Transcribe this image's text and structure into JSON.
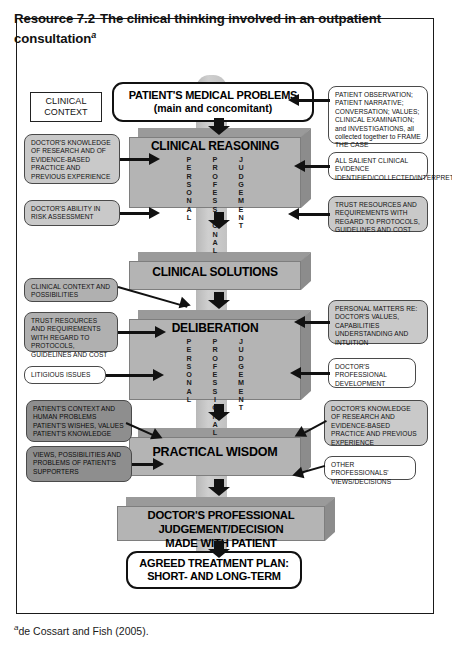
{
  "header": {
    "resource_label": "Resource 7.2",
    "title": "The clinical thinking involved in an outpatient consultation",
    "title_marker": "a"
  },
  "footnote": {
    "marker": "a",
    "text": "de Cossart and Fish (2005)."
  },
  "flow": {
    "patient_problems_line1": "PATIENT'S MEDICAL PROBLEMS",
    "patient_problems_line2": "(main and concomitant)",
    "clinical_reasoning": "CLINICAL REASONING",
    "clinical_solutions": "CLINICAL SOLUTIONS",
    "deliberation": "DELIBERATION",
    "practical_wisdom": "PRACTICAL WISDOM",
    "doctor_decision_line1": "DOCTOR'S PROFESSIONAL JUDGEMENT/DECISION",
    "doctor_decision_line2": "MADE WITH PATIENT",
    "agreed_plan_line1": "AGREED TREATMENT PLAN:",
    "agreed_plan_line2": "SHORT- AND LONG-TERM",
    "vertical_words": [
      "PERSONAL",
      "PROFESSIONAL",
      "JUDGEMENT"
    ]
  },
  "left_notes": {
    "clinical_context": "CLINICAL\nCONTEXT",
    "doctors_knowledge": "DOCTOR'S KNOWLEDGE OF RESEARCH AND OF EVIDENCE-BASED PRACTICE AND PREVIOUS EXPERIENCE",
    "doctors_risk": "DOCTOR'S ABILITY IN RISK ASSESSMENT",
    "clinical_context_possibilities": "CLINICAL CONTEXT AND POSSIBILITIES",
    "trust_resources": "TRUST RESOURCES AND REQUIREMENTS WITH REGARD TO PROTOCOLS, GUIDELINES AND COST",
    "litigious_issues": "LITIGIOUS ISSUES",
    "patients_context": "PATIENT'S CONTEXT AND HUMAN PROBLEMS PATIENT'S WISHES, VALUES PATIENT'S KNOWLEDGE",
    "views_possibilities": "VIEWS, POSSIBILITIES AND PROBLEMS OF PATIENT'S SUPPORTERS"
  },
  "right_notes": {
    "patient_observation": "PATIENT OBSERVATION; PATIENT NARRATIVE; CONVERSATION; VALUES; CLINICAL EXAMINATION; and INVESTIGATIONS, all collected together to FRAME THE CASE",
    "salient_evidence": "ALL SALIENT CLINICAL EVIDENCE IDENTIFIED/COLLECTED/INTERPRETED",
    "trust_resources": "TRUST RESOURCES AND REQUIREMENTS WITH REGARD TO PROTOCOLS, GUIDELINES AND COST",
    "personal_matters": "PERSONAL MATTERS RE: DOCTOR'S VALUES, CAPABILITIES UNDERSTANDING AND INTUITION",
    "professional_development": "DOCTOR'S PROFESSIONAL DEVELOPMENT",
    "doctors_knowledge": "DOCTOR'S KNOWLEDGE OF RESEARCH AND EVIDENCE-BASED PRACTICE AND PREVIOUS EXPERIENCE",
    "other_professionals": "OTHER PROFESSIONALS' VIEWS/DECISIONS"
  }
}
